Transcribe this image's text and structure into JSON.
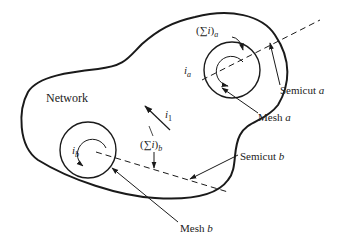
{
  "diagram": {
    "region_label": "Network",
    "mesh_a": {
      "label": "Mesh",
      "var": "a",
      "current_label": "i",
      "current_sub": "a"
    },
    "mesh_b": {
      "label": "Mesh",
      "var": "b",
      "current_label": "i",
      "current_sub": "b"
    },
    "semicut_a": {
      "label": "Semicut",
      "var": "a"
    },
    "semicut_b": {
      "label": "Semicut",
      "var": "b"
    },
    "sum_a": {
      "open": "(",
      "sigma": "∑",
      "i": "i",
      "close": ")",
      "sub": "a"
    },
    "sum_b": {
      "open": "(",
      "sigma": "∑",
      "i": "i",
      "close": ")",
      "sub": "b"
    },
    "i1": {
      "label": "i",
      "sub": "1"
    },
    "colors": {
      "stroke": "#1a1a1a",
      "text": "#222222"
    }
  }
}
